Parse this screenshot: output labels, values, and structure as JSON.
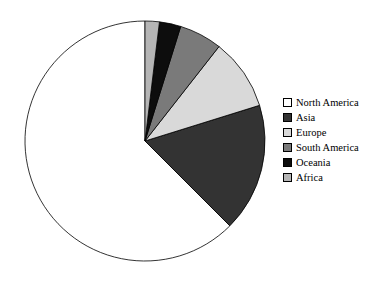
{
  "chart_data": {
    "type": "pie",
    "title": "",
    "categories": [
      "North America",
      "Asia",
      "Europe",
      "South America",
      "Oceania",
      "Africa"
    ],
    "values": [
      65,
      18,
      10,
      6,
      3,
      2
    ],
    "unit": "%",
    "slice_colors": [
      "#ffffff",
      "#333333",
      "#d9d9d9",
      "#7a7a7a",
      "#0d0d0d",
      "#b5b5b5"
    ],
    "slice_edge_color": "#000000",
    "start_angle_deg": 90,
    "direction": "counterclockwise",
    "legend": {
      "position": "right",
      "entries": [
        {
          "label": "North America",
          "color": "#ffffff"
        },
        {
          "label": "Asia",
          "color": "#333333"
        },
        {
          "label": "Europe",
          "color": "#d9d9d9"
        },
        {
          "label": "South America",
          "color": "#7a7a7a"
        },
        {
          "label": "Oceania",
          "color": "#0d0d0d"
        },
        {
          "label": "Africa",
          "color": "#b5b5b5"
        }
      ]
    },
    "grid": false,
    "xlabel": "",
    "ylabel": ""
  },
  "figure": {
    "background": "#ffffff",
    "center_x": 145,
    "center_y": 141,
    "radius": 120
  }
}
